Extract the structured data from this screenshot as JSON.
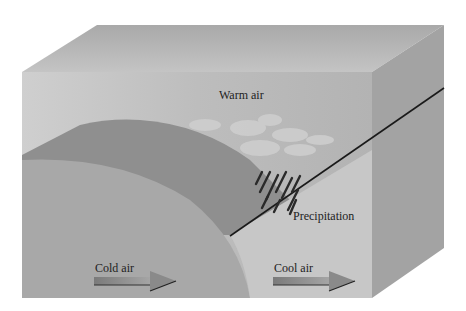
{
  "diagram": {
    "labels": {
      "warm_air": "Warm air",
      "precipitation": "Precipitation",
      "cold_air": "Cold air",
      "cool_air": "Cool air"
    },
    "colors": {
      "top_face": "#a8a8a8",
      "front_face": "#b9b9b9",
      "right_face": "#9a9a9a",
      "cold_air_mass": "#a9a9a9",
      "overriding_layer": "#8e8e8e",
      "cool_wedge": "#c6c6c6",
      "front_line": "#1a1a1a",
      "precip_marks": "#2a2a2a",
      "arrow": "#8c8c8c"
    }
  }
}
